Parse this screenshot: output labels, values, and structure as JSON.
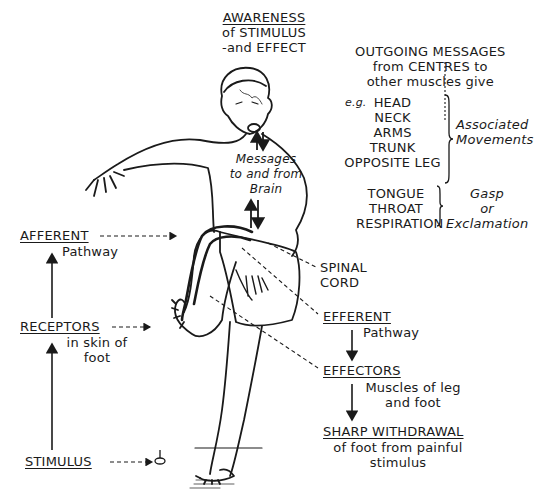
{
  "diagram": {
    "top": {
      "heading": "AWARENESS",
      "line2": "of STIMULUS",
      "line3": "-and EFFECT"
    },
    "outgoing": {
      "line1": "OUTGOING MESSAGES",
      "line2": "from CENTRES to",
      "line3": "other muscles give",
      "eg": "e.g.",
      "items": [
        "HEAD",
        "NECK",
        "ARMS",
        "TRUNK",
        "OPPOSITE LEG"
      ],
      "result_line1": "Associated",
      "result_line2": "Movements"
    },
    "gasp": {
      "items": [
        "TONGUE",
        "THROAT",
        "RESPIRATION"
      ],
      "result_line1": "Gasp",
      "result_line2": "or",
      "result_line3": "Exclamation"
    },
    "messages": {
      "line1": "Messages",
      "line2": "to and from",
      "line3": "Brain"
    },
    "left_chain": {
      "afferent": {
        "heading": "AFFERENT",
        "sub": "Pathway"
      },
      "receptors": {
        "heading": "RECEPTORS",
        "sub1": "in skin of",
        "sub2": "foot"
      },
      "stimulus": {
        "heading": "STIMULUS"
      }
    },
    "right_chain": {
      "spinal_cord": {
        "line1": "SPINAL",
        "line2": "CORD"
      },
      "efferent": {
        "heading": "EFFERENT",
        "sub": "Pathway"
      },
      "effectors": {
        "heading": "EFFECTORS",
        "sub1": "Muscles of leg",
        "sub2": "and foot"
      },
      "withdrawal": {
        "heading": "SHARP WITHDRAWAL",
        "sub1": "of foot from painful",
        "sub2": "stimulus"
      }
    }
  }
}
